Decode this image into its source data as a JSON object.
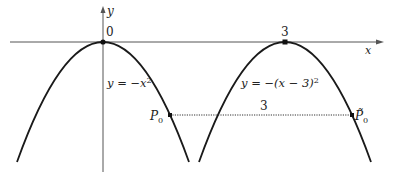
{
  "diagram": {
    "axes": {
      "x_label": "x",
      "y_label": "y",
      "origin_label": "0"
    },
    "curves": [
      {
        "id": "left-parabola",
        "label": "y = −x²",
        "vertex_x": 0,
        "vertex_label": "0"
      },
      {
        "id": "right-parabola",
        "label": "y = −(x − 3)²",
        "vertex_x": 3,
        "vertex_label": "3"
      }
    ],
    "points": [
      {
        "id": "P0",
        "label": "P",
        "subscript": "0"
      },
      {
        "id": "P0-tilde",
        "label": "P̃",
        "subscript": "0"
      }
    ],
    "segment": {
      "label": "3",
      "style": "dotted"
    },
    "colors": {
      "curve": "#1a1a1a",
      "axis": "#555555",
      "text": "#222222"
    }
  }
}
